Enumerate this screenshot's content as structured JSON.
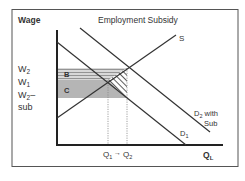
{
  "diagram": {
    "title": "Employment Subsidy",
    "y_axis_label": "Wage",
    "x_axis_label": "Q",
    "x_axis_label_sub": "L",
    "wage_labels": {
      "w2": "W",
      "w2_sub": "2",
      "w1": "W",
      "w1_sub": "1",
      "w2sub_line1": "W",
      "w2sub_sub": "2",
      "w2sub_dash": "–",
      "w2sub_line2": "sub"
    },
    "quantity_labels": {
      "q1": "Q",
      "q1_sub": "1",
      "q2": "Q",
      "q2_sub": "2",
      "arrow": "→"
    },
    "curves": {
      "supply": "S",
      "d1": "D",
      "d1_sub": "1",
      "d2": "D",
      "d2_sub": "2",
      "d2_suffix": " with",
      "d2_line2": "Sub"
    },
    "areas": {
      "b": "B",
      "c": "C"
    },
    "colors": {
      "frame": "#555555",
      "line": "#333333",
      "area_c": "#b8b8b8",
      "area_b": "#cfcfcf",
      "text": "#333333"
    }
  }
}
